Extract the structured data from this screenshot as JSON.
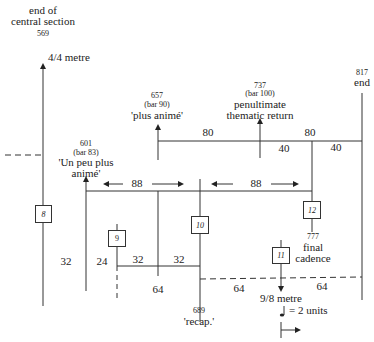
{
  "diagram": {
    "markers": {
      "m569": {
        "number": "569",
        "line1": "end of",
        "line2": "central section"
      },
      "metre44": "4/4 metre",
      "m601": {
        "number": "601",
        "bar": "(bar 83)",
        "line1": "'Un peu plus",
        "line2": "animé'"
      },
      "m657": {
        "number": "657",
        "bar": "(bar 90)",
        "line1": "'plus animé'"
      },
      "m737": {
        "number": "737",
        "bar": "(bar 100)",
        "line1": "penultimate",
        "line2": "thematic return"
      },
      "m817": {
        "number": "817",
        "line1": "end"
      },
      "m777": {
        "number": "777",
        "line1": "final",
        "line2": "cadence"
      },
      "m689": {
        "number": "689",
        "line1": "'recap.'"
      },
      "metre98": "9/8 metre",
      "unit_note": "= 2 units"
    },
    "durations": {
      "d80a": "80",
      "d80b": "80",
      "d40a": "40",
      "d40b": "40",
      "d88a": "88",
      "d88b": "88",
      "d32a": "32",
      "d24": "24",
      "d32b": "32",
      "d32c": "32",
      "d64a": "64",
      "d64b": "64",
      "d64c": "64"
    },
    "boxes": [
      "8",
      "9",
      "10",
      "11",
      "12"
    ]
  }
}
